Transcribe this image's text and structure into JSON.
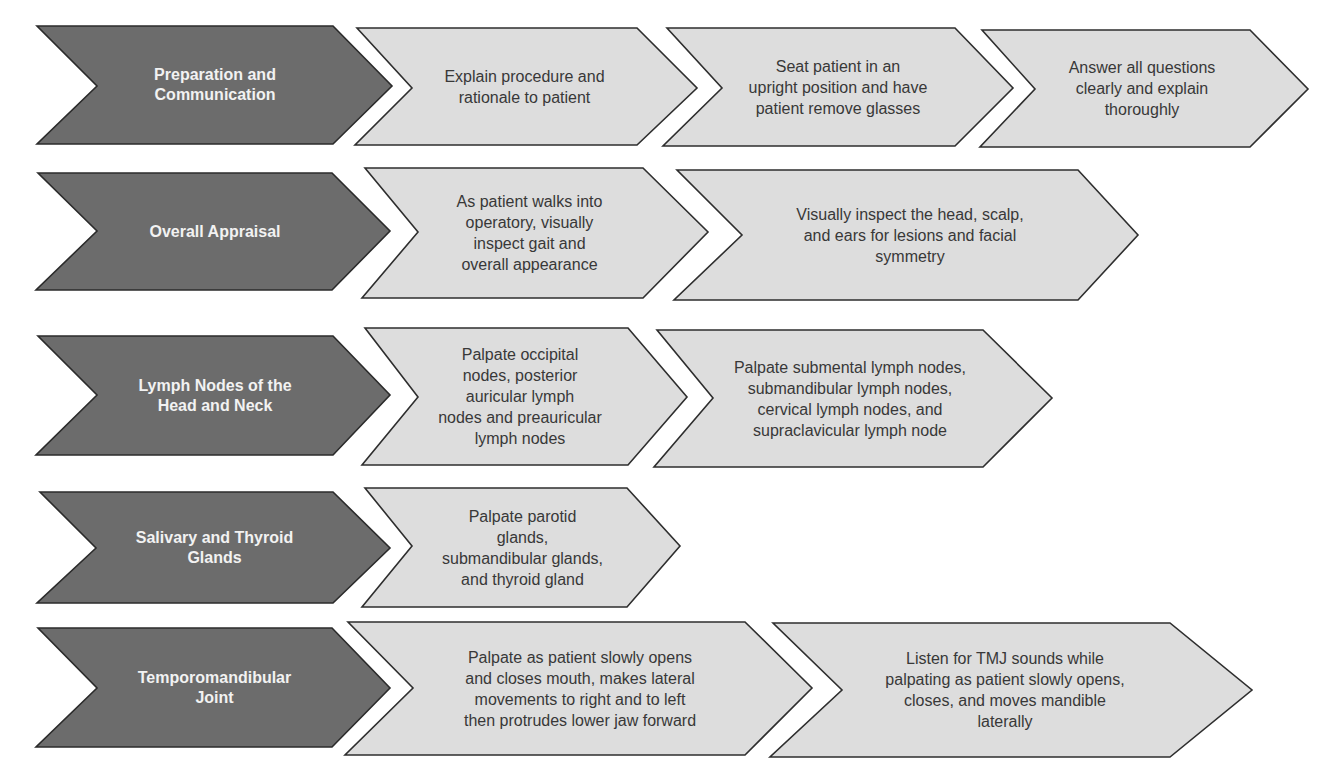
{
  "colors": {
    "category_fill": "#6c6c6c",
    "step_fill": "#dddddd",
    "outline": "#2b2b2b",
    "category_text": "#f2f2f2",
    "step_text": "#383838"
  },
  "rows": [
    {
      "category": "Preparation and Communication",
      "category_lines": [
        "Preparation and",
        "Communication"
      ],
      "steps": [
        {
          "text": "Explain procedure and rationale to patient",
          "lines": [
            "Explain procedure and",
            "rationale to patient"
          ]
        },
        {
          "text": "Seat patient in an upright position and have patient remove glasses",
          "lines": [
            "Seat patient in an",
            "upright position and have",
            "patient remove glasses"
          ]
        },
        {
          "text": "Answer all questions clearly and explain thoroughly",
          "lines": [
            "Answer all questions",
            "clearly and explain",
            "thoroughly"
          ]
        }
      ]
    },
    {
      "category": "Overall Appraisal",
      "category_lines": [
        "Overall Appraisal"
      ],
      "steps": [
        {
          "text": "As patient walks into operatory, visually inspect gait and overall appearance",
          "lines": [
            "As patient walks into",
            "operatory, visually",
            "inspect gait and",
            "overall appearance"
          ]
        },
        {
          "text": "Visually inspect the head, scalp, and ears for lesions and facial symmetry",
          "lines": [
            "Visually inspect the head, scalp,",
            "and ears for lesions and facial",
            "symmetry"
          ]
        }
      ]
    },
    {
      "category": "Lymph Nodes of the Head and Neck",
      "category_lines": [
        "Lymph Nodes of the",
        "Head and Neck"
      ],
      "steps": [
        {
          "text": "Palpate occipital nodes, posterior auricular lymph nodes and preauricular lymph nodes",
          "lines": [
            "Palpate occipital",
            "nodes, posterior",
            "auricular lymph",
            "nodes and preauricular",
            "lymph nodes"
          ]
        },
        {
          "text": "Palpate submental lymph nodes, submandibular lymph nodes, cervical lymph nodes, and supraclavicular lymph node",
          "lines": [
            "Palpate submental lymph nodes,",
            "submandibular lymph nodes,",
            "cervical lymph nodes, and",
            "supraclavicular lymph node"
          ]
        }
      ]
    },
    {
      "category": "Salivary and Thyroid Glands",
      "category_lines": [
        "Salivary and Thyroid",
        "Glands"
      ],
      "steps": [
        {
          "text": "Palpate parotid glands, submandibular glands, and thyroid gland",
          "lines": [
            "Palpate parotid",
            "glands,",
            "submandibular glands,",
            "and thyroid gland"
          ]
        }
      ]
    },
    {
      "category": "Temporomandibular Joint",
      "category_lines": [
        "Temporomandibular",
        "Joint"
      ],
      "steps": [
        {
          "text": "Palpate as patient slowly opens and closes mouth, makes lateral movements to right and to left then protrudes lower jaw forward",
          "lines": [
            "Palpate as patient slowly opens",
            "and closes mouth, makes lateral",
            "movements to right and to left",
            "then protrudes lower jaw forward"
          ]
        },
        {
          "text": "Listen for TMJ sounds while palpating as patient slowly opens, closes, and moves mandible laterally",
          "lines": [
            "Listen for TMJ sounds while",
            "palpating as patient slowly opens,",
            "closes, and moves mandible",
            "laterally"
          ]
        }
      ]
    }
  ]
}
